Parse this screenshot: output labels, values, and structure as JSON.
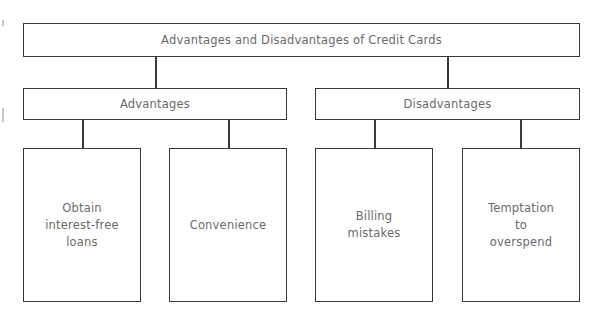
{
  "diagram": {
    "title": "Advantages and Disadvantages of Credit Cards",
    "categories": [
      {
        "label": "Advantages",
        "items": [
          "Obtain\ninterest-free\nloans",
          "Convenience"
        ]
      },
      {
        "label": "Disadvantages",
        "items": [
          "Billing\nmistakes",
          "Temptation\nto\noverspend"
        ]
      }
    ]
  }
}
